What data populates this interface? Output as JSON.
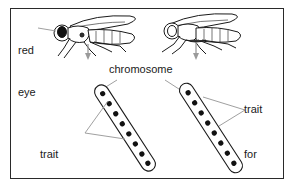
{
  "diagram": {
    "labels": {
      "red_eye_top": [
        "red",
        "eye"
      ],
      "chromosome": "chromosome",
      "trait_red": [
        "trait",
        "for red",
        "eye"
      ],
      "trait_white": [
        "trait",
        "for",
        "white",
        "eye"
      ]
    },
    "flies": [
      {
        "name": "red-eyed fly",
        "eye": "red"
      },
      {
        "name": "white-eyed fly",
        "eye": "white"
      }
    ],
    "chromosomes": [
      {
        "name": "red-eye chromosome",
        "gene_count": 8
      },
      {
        "name": "white-eye chromosome",
        "gene_count": 8
      }
    ],
    "colors": {
      "line": "#1a1a1a",
      "pointer": "#a0a0a0",
      "arrow": "#9a9a9a"
    }
  }
}
